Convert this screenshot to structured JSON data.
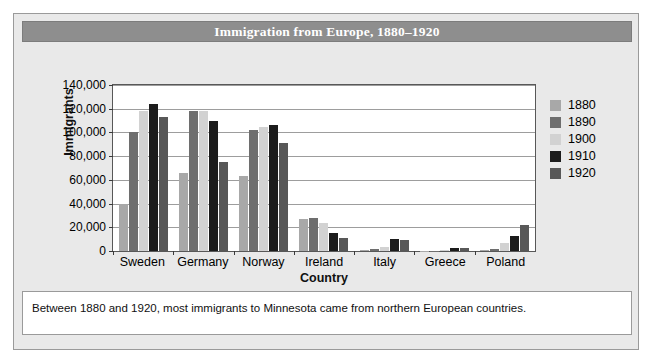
{
  "figure": {
    "title": "Immigration from Europe, 1880–1920",
    "caption": "Between 1880 and 1920, most immigrants to Minnesota came from northern European countries."
  },
  "colors": {
    "title_bar": "#8e8e8e",
    "card_background": "#e9e9e9",
    "plot_background": "#ffffff",
    "gridline": "#9d9d9d",
    "series_1880": "#a8a8a8",
    "series_1890": "#6e6e6e",
    "series_1900": "#d2d2d2",
    "series_1910": "#1c1c1c",
    "series_1920": "#585858"
  },
  "chart_data": {
    "type": "bar",
    "title": "Immigration from Europe, 1880–1920",
    "xlabel": "Country",
    "ylabel": "Immigrants",
    "ylim": [
      0,
      140000
    ],
    "ytick_labels": [
      "0",
      "20,000",
      "40,000",
      "60,000",
      "80,000",
      "100,000",
      "120,000",
      "140,000"
    ],
    "ytick_values": [
      0,
      20000,
      40000,
      60000,
      80000,
      100000,
      120000,
      140000
    ],
    "grid": true,
    "legend_position": "right",
    "categories": [
      "Sweden",
      "Germany",
      "Norway",
      "Ireland",
      "Italy",
      "Greece",
      "Poland"
    ],
    "series": [
      {
        "name": "1880",
        "color": "#a8a8a8",
        "values": [
          40000,
          66000,
          63000,
          27000,
          1000,
          200,
          500
        ]
      },
      {
        "name": "1890",
        "color": "#6e6e6e",
        "values": [
          100000,
          118000,
          102000,
          28000,
          2000,
          300,
          1500
        ]
      },
      {
        "name": "1900",
        "color": "#d2d2d2",
        "values": [
          118000,
          118000,
          105000,
          24000,
          3000,
          500,
          7000
        ]
      },
      {
        "name": "1910",
        "color": "#1c1c1c",
        "values": [
          124000,
          110000,
          106000,
          15000,
          10000,
          2500,
          13000
        ]
      },
      {
        "name": "1920",
        "color": "#585858",
        "values": [
          113000,
          75000,
          91000,
          11000,
          9000,
          2500,
          22000
        ]
      }
    ]
  }
}
